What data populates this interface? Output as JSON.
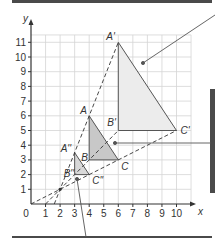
{
  "diagram": {
    "type": "enlargement-on-grid",
    "axes": {
      "x_label": "x",
      "y_label": "y",
      "origin_label": "0",
      "x_ticks": [
        "1",
        "2",
        "3",
        "4",
        "5",
        "6",
        "7",
        "8",
        "9",
        "10"
      ],
      "y_ticks": [
        "1",
        "2",
        "3",
        "4",
        "5",
        "6",
        "7",
        "8",
        "9",
        "10",
        "11"
      ],
      "x_range": [
        0,
        11
      ],
      "y_range": [
        0,
        11.5
      ],
      "grid": true
    },
    "centre_of_enlargement": {
      "x": 2,
      "y": 1
    },
    "triangles": [
      {
        "name": "ABC",
        "role": "object",
        "fill": "#c8c8c8",
        "vertices": [
          {
            "label": "A",
            "x": 4,
            "y": 6
          },
          {
            "label": "B",
            "x": 4,
            "y": 3
          },
          {
            "label": "C",
            "x": 6,
            "y": 3
          }
        ]
      },
      {
        "name": "A'B'C'",
        "role": "image scale factor 2",
        "fill": "#ececec",
        "vertices": [
          {
            "label": "A'",
            "x": 6,
            "y": 11
          },
          {
            "label": "B'",
            "x": 6,
            "y": 5
          },
          {
            "label": "C'",
            "x": 10,
            "y": 5
          }
        ]
      },
      {
        "name": "A''B''C''",
        "role": "image scale factor 1/2",
        "fill": "#d8d8d8",
        "vertices": [
          {
            "label": "A''",
            "x": 3,
            "y": 3.5
          },
          {
            "label": "B''",
            "x": 3,
            "y": 2
          },
          {
            "label": "C''",
            "x": 4,
            "y": 2
          }
        ]
      }
    ],
    "colors": {
      "grid": "#d4d4d4",
      "axis": "#333333",
      "triangle_edge": "#555555",
      "callout": "#555555",
      "panel_dark": "#4a4a4a"
    }
  }
}
